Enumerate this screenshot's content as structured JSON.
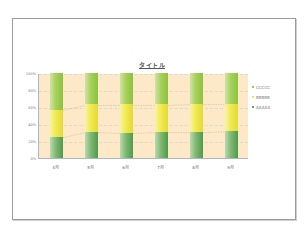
{
  "chart_data": {
    "type": "bar",
    "stacked": "percent",
    "title": "タイトル",
    "xlabel": "",
    "ylabel": "",
    "categories": [
      "4月",
      "5月",
      "6月",
      "7月",
      "8月",
      "9月"
    ],
    "series": [
      {
        "name": "AAAAA",
        "values": [
          25,
          31,
          30,
          31,
          31,
          32
        ],
        "color": "#6aa85e"
      },
      {
        "name": "BBBBB",
        "values": [
          32,
          32,
          33,
          32,
          33,
          32
        ],
        "color": "#eee84a"
      },
      {
        "name": "CCCCC",
        "values": [
          43,
          37,
          37,
          37,
          36,
          36
        ],
        "color": "#9ccb4c"
      }
    ],
    "ylim": [
      0,
      100
    ],
    "yticks": [
      "0%",
      "20%",
      "40%",
      "60%",
      "80%",
      "100%"
    ],
    "grid": true,
    "legend_position": "right",
    "series_lines": true,
    "plot_background": "#fde9c8"
  },
  "legend": [
    {
      "label": "CCCCC",
      "color": "#9ccb4c"
    },
    {
      "label": "BBBBB",
      "color": "#eee84a"
    },
    {
      "label": "AAAAA",
      "color": "#6aa85e"
    }
  ]
}
